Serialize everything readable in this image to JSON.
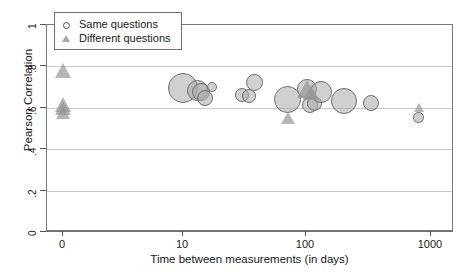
{
  "chart_data": {
    "type": "scatter",
    "title": "",
    "xlabel": "Time between measurements (in days)",
    "ylabel": "Pearson Correlation",
    "xscale": "log-with-zero-break",
    "xticks": [
      "0",
      "10",
      "100",
      "1000"
    ],
    "yticks": [
      "0",
      ".2",
      ".4",
      ".6",
      ".8",
      "1"
    ],
    "ylim": [
      0,
      1
    ],
    "grid": "horizontal",
    "legend_position": "top-left",
    "series": [
      {
        "name": "Same questions",
        "marker": "circle",
        "points": [
          {
            "x": 10,
            "y": 0.695,
            "size": 30
          },
          {
            "x": 13,
            "y": 0.685,
            "size": 21
          },
          {
            "x": 14,
            "y": 0.675,
            "size": 18
          },
          {
            "x": 15,
            "y": 0.645,
            "size": 16
          },
          {
            "x": 17,
            "y": 0.7,
            "size": 10
          },
          {
            "x": 30,
            "y": 0.66,
            "size": 14
          },
          {
            "x": 34,
            "y": 0.655,
            "size": 14
          },
          {
            "x": 38,
            "y": 0.72,
            "size": 17
          },
          {
            "x": 70,
            "y": 0.64,
            "size": 27
          },
          {
            "x": 100,
            "y": 0.69,
            "size": 20
          },
          {
            "x": 105,
            "y": 0.615,
            "size": 16
          },
          {
            "x": 115,
            "y": 0.62,
            "size": 15
          },
          {
            "x": 130,
            "y": 0.675,
            "size": 22
          },
          {
            "x": 200,
            "y": 0.635,
            "size": 26
          },
          {
            "x": 330,
            "y": 0.625,
            "size": 16
          },
          {
            "x": 800,
            "y": 0.555,
            "size": 11
          }
        ]
      },
      {
        "name": "Different questions",
        "marker": "triangle",
        "points": [
          {
            "x": 0,
            "y": 0.78,
            "size": 17
          },
          {
            "x": 0,
            "y": 0.615,
            "size": 17
          },
          {
            "x": 0,
            "y": 0.595,
            "size": 16
          },
          {
            "x": 0,
            "y": 0.575,
            "size": 15
          },
          {
            "x": 70,
            "y": 0.55,
            "size": 14
          },
          {
            "x": 100,
            "y": 0.69,
            "size": 20
          },
          {
            "x": 108,
            "y": 0.67,
            "size": 17
          },
          {
            "x": 800,
            "y": 0.6,
            "size": 10
          }
        ]
      }
    ]
  },
  "legend": {
    "items": [
      {
        "label": "Same questions",
        "marker": "circle"
      },
      {
        "label": "Different questions",
        "marker": "triangle"
      }
    ]
  },
  "axes": {
    "x_title": "Time between measurements (in days)",
    "y_title": "Pearson Correlation",
    "x_tick_labels": [
      "0",
      "10",
      "100",
      "1000"
    ],
    "y_tick_labels": [
      "1",
      ".8",
      ".6",
      ".4",
      ".2",
      "0"
    ]
  },
  "colors": {
    "marker_fill": "#aaaaaa",
    "marker_edge": "#6e6e6e",
    "gridline": "#c9c9c9",
    "frame": "#7a7a7a",
    "text": "#1a1a1a"
  }
}
